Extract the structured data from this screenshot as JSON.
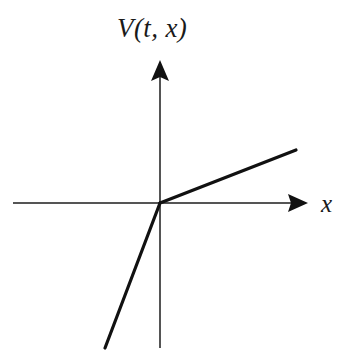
{
  "figure": {
    "background_color": "#ffffff",
    "width": 352,
    "height": 364,
    "vertical_axis_label": "V(t, x)",
    "horizontal_axis_label": "x"
  },
  "chart_data": {
    "type": "line",
    "title": "",
    "subtitle": "",
    "xlabel": "x",
    "ylabel": "V(t, x)",
    "legend": [],
    "legend_position": "none",
    "grid": false,
    "axes": {
      "origin_px": [
        160,
        203
      ],
      "x_axis_from_px": [
        13,
        203
      ],
      "x_axis_to_px": [
        308,
        203
      ],
      "y_axis_from_px": [
        160,
        348
      ],
      "y_axis_to_px": [
        160,
        60
      ],
      "x_arrow": "right",
      "y_arrow": "up",
      "axis_color": "#555555",
      "axis_width_px": 1.6,
      "tick_labels_x": [],
      "tick_labels_y": []
    },
    "series": [
      {
        "name": "V(t, x)",
        "description": "piecewise linear, kink at origin",
        "color": "#111111",
        "line_width_px": 3.2,
        "points_px": [
          [
            105,
            348
          ],
          [
            160,
            203
          ],
          [
            296,
            150
          ]
        ],
        "segments": [
          {
            "name": "steep-negative-branch",
            "from_px": [
              105,
              348
            ],
            "to_px": [
              160,
              203
            ],
            "slope_sign": "steep positive"
          },
          {
            "name": "shallow-positive-branch",
            "from_px": [
              160,
              203
            ],
            "to_px": [
              296,
              150
            ],
            "slope_sign": "shallow positive"
          }
        ]
      }
    ],
    "annotations": [
      {
        "name": "v-axis-label",
        "text": "V(t, x)",
        "position_px": [
          117,
          13
        ]
      },
      {
        "name": "x-axis-label",
        "text": "x",
        "position_px": [
          321,
          190
        ]
      }
    ]
  }
}
